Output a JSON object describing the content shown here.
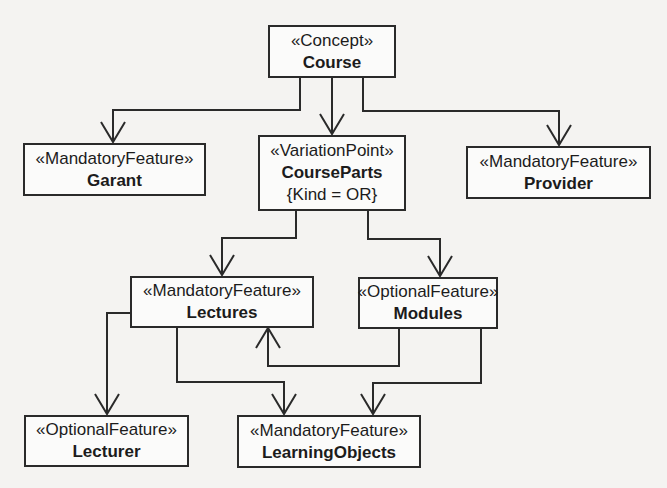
{
  "diagram": {
    "type": "feature-model",
    "line_color": "#2a2a2a",
    "nodes": {
      "course": {
        "stereotype": "«Concept»",
        "name": "Course"
      },
      "garant": {
        "stereotype": "«MandatoryFeature»",
        "name": "Garant"
      },
      "course_parts": {
        "stereotype": "«VariationPoint»",
        "name": "CourseParts",
        "constraint": "{Kind = OR}"
      },
      "provider": {
        "stereotype": "«MandatoryFeature»",
        "name": "Provider"
      },
      "lectures": {
        "stereotype": "«MandatoryFeature»",
        "name": "Lectures"
      },
      "modules": {
        "stereotype": "«OptionalFeature»",
        "name": "Modules"
      },
      "lecturer": {
        "stereotype": "«OptionalFeature»",
        "name": "Lecturer"
      },
      "learning_objects": {
        "stereotype": "«MandatoryFeature»",
        "name": "LearningObjects"
      }
    },
    "edges": [
      {
        "from": "Course",
        "to": "Garant"
      },
      {
        "from": "Course",
        "to": "CourseParts"
      },
      {
        "from": "Course",
        "to": "Provider"
      },
      {
        "from": "CourseParts",
        "to": "Lectures"
      },
      {
        "from": "CourseParts",
        "to": "Modules"
      },
      {
        "from": "Modules",
        "to": "Lectures"
      },
      {
        "from": "Lectures",
        "to": "Lecturer"
      },
      {
        "from": "Lectures",
        "to": "LearningObjects"
      },
      {
        "from": "Modules",
        "to": "LearningObjects"
      }
    ]
  }
}
